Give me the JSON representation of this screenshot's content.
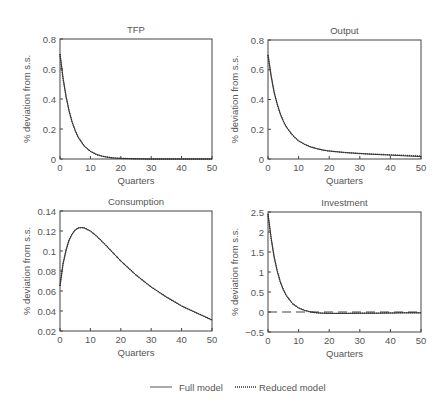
{
  "chart_data": [
    {
      "type": "line",
      "title": "TFP",
      "xlabel": "Quarters",
      "ylabel": "% deviation from s.s.",
      "xlim": [
        0,
        50
      ],
      "ylim": [
        0,
        0.8
      ],
      "xticks": [
        0,
        10,
        20,
        30,
        40,
        50
      ],
      "yticks": [
        0,
        0.2,
        0.4,
        0.6,
        0.8
      ],
      "ytick_labels": [
        "0",
        "0.2",
        "0.4",
        "0.6",
        "0.8"
      ],
      "grid": false,
      "x": [
        0,
        1,
        2,
        3,
        4,
        5,
        6,
        8,
        10,
        12,
        14,
        16,
        18,
        20,
        25,
        30,
        40,
        50
      ],
      "series": [
        {
          "name": "Full model",
          "values": [
            0.7,
            0.54,
            0.415,
            0.32,
            0.245,
            0.19,
            0.145,
            0.086,
            0.051,
            0.03,
            0.018,
            0.011,
            0.006,
            0.004,
            0.001,
            0.0,
            0.0,
            0.0
          ]
        },
        {
          "name": "Reduced model",
          "values": [
            0.7,
            0.54,
            0.415,
            0.32,
            0.245,
            0.19,
            0.145,
            0.086,
            0.051,
            0.03,
            0.018,
            0.011,
            0.006,
            0.004,
            0.001,
            0.0,
            0.0,
            0.0
          ]
        }
      ]
    },
    {
      "type": "line",
      "title": "Output",
      "xlabel": "Quarters",
      "ylabel": "% deviation from s.s.",
      "xlim": [
        0,
        50
      ],
      "ylim": [
        0,
        0.8
      ],
      "xticks": [
        0,
        10,
        20,
        30,
        40,
        50
      ],
      "yticks": [
        0,
        0.2,
        0.4,
        0.6,
        0.8
      ],
      "ytick_labels": [
        "0",
        "0.2",
        "0.4",
        "0.6",
        "0.8"
      ],
      "grid": false,
      "x": [
        0,
        1,
        2,
        3,
        4,
        5,
        6,
        8,
        10,
        12,
        14,
        16,
        18,
        20,
        25,
        30,
        35,
        40,
        45,
        50
      ],
      "series": [
        {
          "name": "Full model",
          "values": [
            0.7,
            0.56,
            0.45,
            0.37,
            0.305,
            0.255,
            0.215,
            0.16,
            0.122,
            0.098,
            0.081,
            0.069,
            0.06,
            0.054,
            0.044,
            0.037,
            0.031,
            0.026,
            0.021,
            0.017
          ]
        },
        {
          "name": "Reduced model",
          "values": [
            0.7,
            0.56,
            0.45,
            0.37,
            0.305,
            0.255,
            0.215,
            0.16,
            0.122,
            0.098,
            0.081,
            0.069,
            0.06,
            0.054,
            0.044,
            0.037,
            0.032,
            0.028,
            0.024,
            0.021
          ]
        }
      ]
    },
    {
      "type": "line",
      "title": "Consumption",
      "xlabel": "Quarters",
      "ylabel": "% deviation from s.s.",
      "xlim": [
        0,
        50
      ],
      "ylim": [
        0.02,
        0.14
      ],
      "xticks": [
        0,
        10,
        20,
        30,
        40,
        50
      ],
      "yticks": [
        0.02,
        0.04,
        0.06,
        0.08,
        0.1,
        0.12,
        0.14
      ],
      "ytick_labels": [
        "0.02",
        "0.04",
        "0.06",
        "0.08",
        "0.1",
        "0.12",
        "0.14"
      ],
      "grid": false,
      "x": [
        0,
        1,
        2,
        3,
        4,
        5,
        6,
        7,
        8,
        10,
        12,
        15,
        20,
        25,
        30,
        35,
        40,
        45,
        50
      ],
      "series": [
        {
          "name": "Full model",
          "values": [
            0.065,
            0.087,
            0.101,
            0.111,
            0.117,
            0.121,
            0.123,
            0.1235,
            0.123,
            0.12,
            0.115,
            0.106,
            0.09,
            0.076,
            0.064,
            0.054,
            0.045,
            0.038,
            0.031
          ]
        },
        {
          "name": "Reduced model",
          "values": [
            0.065,
            0.087,
            0.101,
            0.111,
            0.117,
            0.121,
            0.123,
            0.1235,
            0.123,
            0.12,
            0.115,
            0.106,
            0.09,
            0.076,
            0.064,
            0.054,
            0.045,
            0.038,
            0.031
          ]
        }
      ]
    },
    {
      "type": "line",
      "title": "Investment",
      "xlabel": "Quarters",
      "ylabel": "% deviation from s.s.",
      "xlim": [
        0,
        50
      ],
      "ylim": [
        -0.5,
        2.5
      ],
      "xticks": [
        0,
        10,
        20,
        30,
        40,
        50
      ],
      "yticks": [
        -0.5,
        0,
        0.5,
        1,
        1.5,
        2,
        2.5
      ],
      "ytick_labels": [
        "−0.5",
        "0",
        "0.5",
        "1",
        "1.5",
        "2",
        "2.5"
      ],
      "grid": false,
      "reference_line": {
        "y": 0,
        "style": "dashed"
      },
      "x": [
        0,
        1,
        2,
        3,
        4,
        5,
        6,
        8,
        10,
        12,
        14,
        16,
        18,
        20,
        25,
        30,
        35,
        40,
        45,
        50
      ],
      "series": [
        {
          "name": "Full model",
          "values": [
            2.45,
            1.85,
            1.38,
            1.03,
            0.76,
            0.56,
            0.41,
            0.21,
            0.1,
            0.04,
            0.0,
            -0.02,
            -0.03,
            -0.035,
            -0.035,
            -0.03,
            -0.03,
            -0.025,
            -0.02,
            -0.02
          ]
        },
        {
          "name": "Reduced model",
          "values": [
            2.45,
            1.85,
            1.38,
            1.03,
            0.76,
            0.56,
            0.41,
            0.21,
            0.1,
            0.04,
            0.0,
            -0.02,
            -0.03,
            -0.035,
            -0.035,
            -0.03,
            -0.03,
            -0.025,
            -0.02,
            -0.02
          ]
        }
      ]
    }
  ],
  "legend": {
    "position": "bottom",
    "items": [
      {
        "label": "Full model",
        "style": "solid"
      },
      {
        "label": "Reduced model",
        "style": "dotted"
      }
    ]
  },
  "colors": {
    "line": "#333333",
    "axis": "#444444",
    "text": "#555555"
  }
}
